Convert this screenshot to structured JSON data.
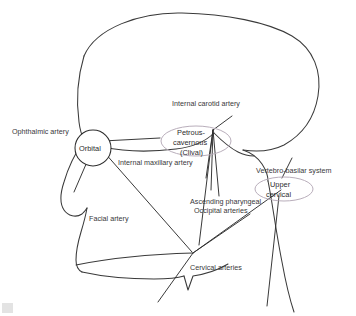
{
  "figure": {
    "background_color": "#ffffff",
    "outline_color": "#3a3a3a",
    "vessel_color": "#2e2e2e",
    "node_ellipse_color": "#b9aebb"
  },
  "labels": {
    "internal_carotid_artery": "Internal carotid artery",
    "ophthalmic_artery": "Ophthalmic artery",
    "internal_maxillary_artery": "Internal maxillary artery",
    "vertebro_basilar_system": "Vertebro-basilar system",
    "ascending_pharyngeal": "Ascending pharyngeal",
    "occipital_arteries": "Occipital arteries",
    "facial_artery": "Facial artery",
    "cervical_arteries": "Cervical arteries"
  },
  "nodes": {
    "orbital": {
      "label": "Orbital",
      "shape": "circle"
    },
    "petrous_cavernous": {
      "line1": "Petrous-",
      "line2": "cavernous",
      "line3": "(Clival)",
      "shape": "ellipse"
    },
    "upper_cervical": {
      "line1": "Upper",
      "line2": "cervical",
      "shape": "ellipse"
    }
  }
}
